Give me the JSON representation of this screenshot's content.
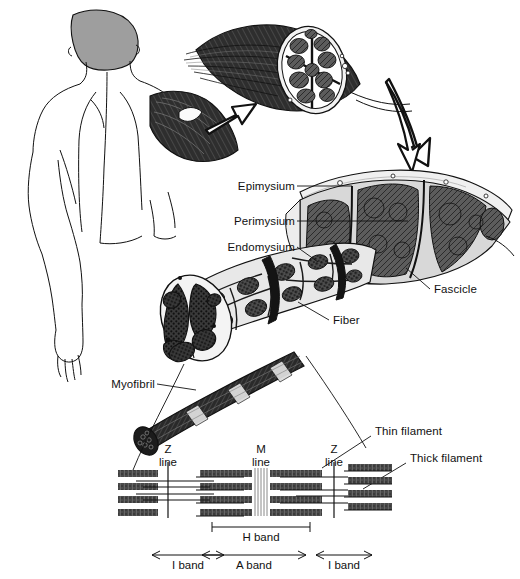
{
  "figure": {
    "background": "#ffffff",
    "ink_color": "#111111",
    "filament_color": "#4a4a4a",
    "hair_fill": "#9e9e9e",
    "credit_text": ""
  },
  "labels": {
    "epimysium": "Epimysium",
    "perimysium": "Perimysium",
    "endomysium": "Endomysium",
    "fascicle": "Fascicle",
    "fiber": "Fiber",
    "myofibril": "Myofibril",
    "thin_filament": "Thin filament",
    "thick_filament": "Thick filament"
  },
  "sarcomere": {
    "z_line_left": {
      "line1": "Z",
      "line2": "line"
    },
    "m_line": {
      "line1": "M",
      "line2": "line"
    },
    "z_line_right": {
      "line1": "Z",
      "line2": "line"
    },
    "h_band": "H band",
    "a_band": "A band",
    "i_band_left": "I band",
    "i_band_right": "I band"
  },
  "structure_levels": [
    "Whole muscle",
    "Fascicle",
    "Muscle fiber",
    "Myofibril",
    "Sarcomere filaments"
  ]
}
